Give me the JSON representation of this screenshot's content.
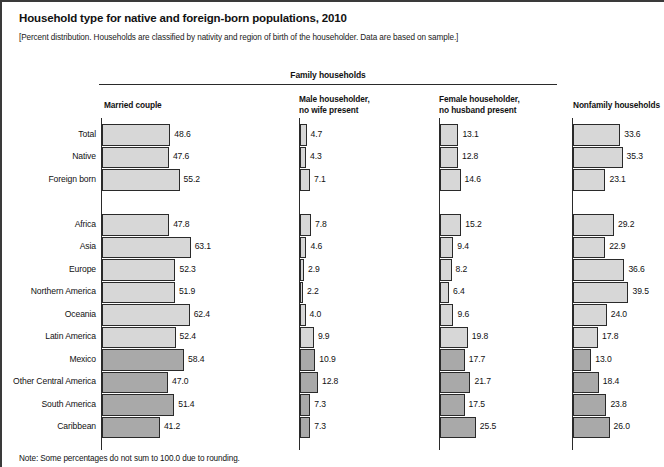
{
  "figure": {
    "title": "Household type for native and foreign-born populations, 2010",
    "subtitle": "[Percent distribution. Households are classified by nativity and region of birth of the householder. Data are based on sample.]",
    "note": "Note: Some percentages do not sum to 100.0 due to rounding.",
    "group_header": "Family households"
  },
  "colors": {
    "bar_light": "#d7d7d7",
    "bar_dark": "#a9a9a9",
    "bar_outline": "#2a2a2a",
    "frame": "#3a3a3a",
    "text": "#111111"
  },
  "chart_data": {
    "type": "bar",
    "title": "Household type for native and foreign-born populations, 2010",
    "subtitle": "[Percent distribution. Households are classified by nativity and region of birth of the householder. Data are based on sample.]",
    "note": "Note: Some percentages do not sum to 100.0 due to rounding.",
    "orientation": "horizontal",
    "grid": false,
    "legend": "none",
    "xlabel": "Percent",
    "ylabel": "",
    "xlim": [
      0,
      65
    ],
    "group_header": "Family households",
    "group_header_columns": [
      "Married couple",
      "Male householder, no wife present",
      "Female householder, no husband present"
    ],
    "categories": [
      "Total",
      "Native",
      "Foreign born",
      "Africa",
      "Asia",
      "Europe",
      "Northern America",
      "Oceania",
      "Latin America",
      "Mexico",
      "Other Central America",
      "South America",
      "Caribbean"
    ],
    "category_shading": [
      "light",
      "light",
      "light",
      "light",
      "light",
      "light",
      "light",
      "light",
      "light",
      "dark",
      "dark",
      "dark",
      "dark"
    ],
    "series": [
      {
        "name": "Married couple",
        "label_lines": [
          "Married couple"
        ],
        "values": [
          48.6,
          47.6,
          55.2,
          47.8,
          63.1,
          52.3,
          51.9,
          62.4,
          52.4,
          58.4,
          47.0,
          51.4,
          41.2
        ]
      },
      {
        "name": "Male householder, no wife present",
        "label_lines": [
          "Male householder,",
          "no wife present"
        ],
        "values": [
          4.7,
          4.3,
          7.1,
          7.8,
          4.6,
          2.9,
          2.2,
          4.0,
          9.9,
          10.9,
          12.8,
          7.3,
          7.3
        ]
      },
      {
        "name": "Female householder, no husband present",
        "label_lines": [
          "Female householder,",
          "no husband present"
        ],
        "values": [
          13.1,
          12.8,
          14.6,
          15.2,
          9.4,
          8.2,
          6.4,
          9.6,
          19.8,
          17.7,
          21.7,
          17.5,
          25.5
        ]
      },
      {
        "name": "Nonfamily households",
        "label_lines": [
          "Nonfamily households"
        ],
        "values": [
          33.6,
          35.3,
          23.1,
          29.2,
          22.9,
          36.6,
          39.5,
          24.0,
          17.8,
          13.0,
          18.4,
          23.8,
          26.0
        ]
      }
    ]
  }
}
